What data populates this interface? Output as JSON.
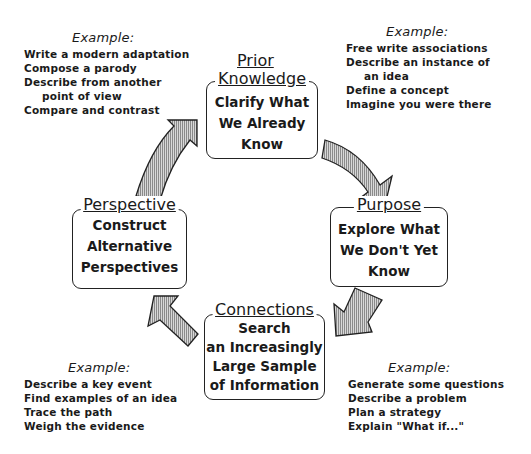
{
  "diagram": {
    "stages": [
      {
        "title_line1": "Prior",
        "title_line2": "Knowledge",
        "body": [
          "Clarify What",
          "We Already",
          "Know"
        ]
      },
      {
        "title": "Purpose",
        "body": [
          "Explore What",
          "We Don't Yet",
          "Know"
        ]
      },
      {
        "title": "Connections",
        "body": [
          "Search",
          "an Increasingly",
          "Large Sample",
          "of Information"
        ]
      },
      {
        "title": "Perspective",
        "body": [
          "Construct",
          "Alternative",
          "Perspectives"
        ]
      }
    ],
    "examples": {
      "top_left": {
        "heading": "Example:",
        "items": [
          "Write a modern adaptation",
          "Compose a parody",
          "Describe from another",
          "point of view",
          "Compare and contrast"
        ]
      },
      "top_right": {
        "heading": "Example:",
        "items": [
          "Free write associations",
          "Describe an instance of",
          "an idea",
          "Define a concept",
          "Imagine you were there"
        ]
      },
      "bottom_left": {
        "heading": "Example:",
        "items": [
          "Describe a key event",
          "Find examples of an idea",
          "Trace the path",
          "Weigh the evidence"
        ]
      },
      "bottom_right": {
        "heading": "Example:",
        "items": [
          "Generate some questions",
          "Describe a problem",
          "Plan a strategy",
          "Explain \"What if...\""
        ]
      }
    },
    "arrow_fill": "#bdbdbd",
    "cycle_direction": "clockwise"
  }
}
